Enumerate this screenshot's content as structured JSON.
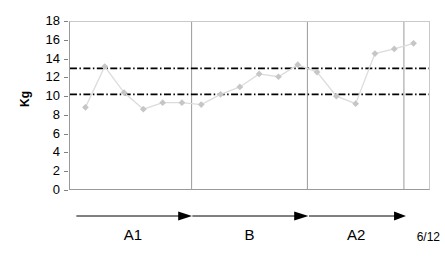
{
  "chart_data": {
    "type": "line",
    "title": "",
    "subtitle": "",
    "xlabel": "",
    "ylabel": "Kg",
    "ylim": [
      0,
      18
    ],
    "ytick_step": 2,
    "yticks": [
      18,
      16,
      14,
      12,
      10,
      8,
      6,
      4,
      2,
      0
    ],
    "grid": false,
    "legend": "none",
    "x_axis_shows_ticks": false,
    "marker": "diamond",
    "marker_color": "#c6c6c6",
    "line_color": "#dcdcdc",
    "series": [
      {
        "name": "Weight",
        "x": [
          1,
          2,
          3,
          4,
          5,
          6,
          7,
          8,
          9,
          10,
          11,
          12,
          13,
          14,
          15,
          16,
          17,
          18
        ],
        "values": [
          8.8,
          13.2,
          10.4,
          8.6,
          9.3,
          9.3,
          9.1,
          10.2,
          11.0,
          12.4,
          12.1,
          13.4,
          12.6,
          10.0,
          9.2,
          14.6,
          15.1,
          15.7
        ]
      }
    ],
    "reference_lines": [
      {
        "name": "upper-reference-line",
        "value": 13.0,
        "style": "dash-dot",
        "color": "#000000",
        "label": ""
      },
      {
        "name": "lower-reference-line",
        "value": 10.2,
        "style": "dash-dot",
        "color": "#000000",
        "label": ""
      }
    ],
    "phase_separators": [
      {
        "name": "separator-a1-b",
        "after_point": 6
      },
      {
        "name": "separator-b-a2",
        "after_point": 12
      },
      {
        "name": "separator-a2-end",
        "after_point": 17
      }
    ],
    "annotations": {
      "phases": [
        {
          "label": "A1",
          "start_point": 1,
          "end_point": 6,
          "arrow": "right"
        },
        {
          "label": "B",
          "start_point": 7,
          "end_point": 12,
          "arrow": "right"
        },
        {
          "label": "A2",
          "start_point": 13,
          "end_point": 17,
          "arrow": "right"
        }
      ],
      "date_label": "6/12"
    }
  }
}
